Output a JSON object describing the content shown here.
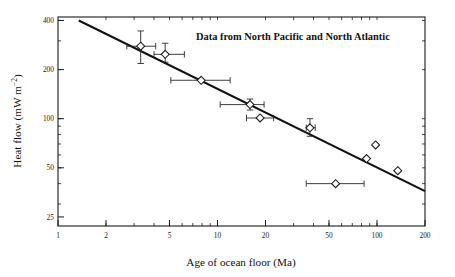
{
  "chart_data": {
    "type": "scatter",
    "title": "Data from North Pacific and North Atlantic",
    "xlabel": "Age of ocean floor (Ma)",
    "ylabel_main": "Heat flow (mW m",
    "ylabel_exponent": "−2",
    "ylabel_close": ")",
    "ylabel_full": "Heat flow (mW m−2)",
    "xscale": "log",
    "yscale": "log",
    "xlim": [
      1,
      200
    ],
    "ylim": [
      22,
      420
    ],
    "grid": false,
    "legend": false,
    "xticks": [
      {
        "value": 1,
        "label": "1"
      },
      {
        "value": 2,
        "label": "2"
      },
      {
        "value": 5,
        "label": "5"
      },
      {
        "value": 10,
        "label": "10"
      },
      {
        "value": 20,
        "label": "20"
      },
      {
        "value": 50,
        "label": "50"
      },
      {
        "value": 100,
        "label": "100"
      },
      {
        "value": 200,
        "label": "200"
      }
    ],
    "yticks": [
      {
        "value": 400,
        "label": "400"
      },
      {
        "value": 200,
        "label": "200"
      },
      {
        "value": 100,
        "label": "100"
      },
      {
        "value": 50,
        "label": "50"
      },
      {
        "value": 25,
        "label": "25"
      }
    ],
    "points": [
      {
        "x": 3.3,
        "y": 278,
        "xerr_low": 2.7,
        "xerr_high": 4.1,
        "yerr_low": 218,
        "yerr_high": 345
      },
      {
        "x": 4.7,
        "y": 248,
        "xerr_low": 4.0,
        "xerr_high": 6.2,
        "yerr_low": 222,
        "yerr_high": 290
      },
      {
        "x": 7.9,
        "y": 172,
        "xerr_low": 5.1,
        "xerr_high": 12.0,
        "yerr_low": 172,
        "yerr_high": 172
      },
      {
        "x": 16.0,
        "y": 122,
        "xerr_low": 10.4,
        "xerr_high": 19.6,
        "yerr_low": 113,
        "yerr_high": 132
      },
      {
        "x": 18.5,
        "y": 101,
        "xerr_low": 15.2,
        "xerr_high": 22.5,
        "yerr_low": 101,
        "yerr_high": 101
      },
      {
        "x": 38.0,
        "y": 88,
        "xerr_low": 36.0,
        "xerr_high": 41.0,
        "yerr_low": 78,
        "yerr_high": 100
      },
      {
        "x": 86.0,
        "y": 57,
        "xerr_low": 86.0,
        "xerr_high": 86.0,
        "yerr_low": 57,
        "yerr_high": 57
      },
      {
        "x": 98.0,
        "y": 69,
        "xerr_low": 98.0,
        "xerr_high": 98.0,
        "yerr_low": 69,
        "yerr_high": 69
      },
      {
        "x": 135.0,
        "y": 48,
        "xerr_low": 135.0,
        "xerr_high": 135.0,
        "yerr_low": 48,
        "yerr_high": 48
      },
      {
        "x": 55.0,
        "y": 40,
        "xerr_low": 36.0,
        "xerr_high": 83.0,
        "yerr_low": 40,
        "yerr_high": 40
      }
    ],
    "trend_line": {
      "x_start": 1.35,
      "y_start": 400,
      "x_end": 200,
      "y_end": 36
    }
  }
}
